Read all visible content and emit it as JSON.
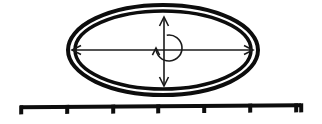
{
  "canvas": {
    "width": 322,
    "height": 124,
    "background_color": "#ffffff",
    "ink_color": "#0d0d0d"
  },
  "diagram": {
    "shapes": {
      "outer_ellipse": {
        "name": "outer-ellipse",
        "cx": 163,
        "cy": 50,
        "rx": 95,
        "ry": 45,
        "stroke_width": 4,
        "color": "#0d0d0d"
      },
      "inner_ellipse": {
        "name": "inner-ellipse",
        "cx": 163,
        "cy": 50,
        "rx": 88,
        "ry": 39,
        "stroke_width": 3.5,
        "color": "#0d0d0d"
      },
      "horizontal_arrow": {
        "name": "horizontal-double-arrow",
        "x1": 72,
        "x2": 253,
        "y": 50,
        "stroke_width": 1.6,
        "head_length": 9,
        "head_half_width": 4.5,
        "color": "#1a1a1a"
      },
      "vertical_arrow": {
        "name": "vertical-double-arrow",
        "y1": 17,
        "y2": 86,
        "x": 164,
        "stroke_width": 1.6,
        "head_length": 9,
        "head_half_width": 4.5,
        "color": "#1a1a1a"
      },
      "rotation_arrow": {
        "name": "rotation-curved-arrow",
        "cx": 169,
        "cy": 48,
        "r": 13,
        "start_angle_deg": -100,
        "sweep_deg": 280,
        "stroke_width": 1.6,
        "color": "#1a1a1a"
      },
      "scale_bar": {
        "name": "measuring-scale-bar",
        "x_start": 20,
        "x_end": 300,
        "y": 108,
        "bar_thickness": 4,
        "tick_count": 8,
        "tick_height": 9,
        "tick_positions": [
          20,
          66,
          112,
          157,
          203,
          249,
          295,
          300
        ],
        "color": "#0d0d0d"
      }
    },
    "labels": {
      "horizontal_arrow": "",
      "vertical_arrow": "",
      "rotation_arrow": "",
      "scale_bar": ""
    }
  }
}
